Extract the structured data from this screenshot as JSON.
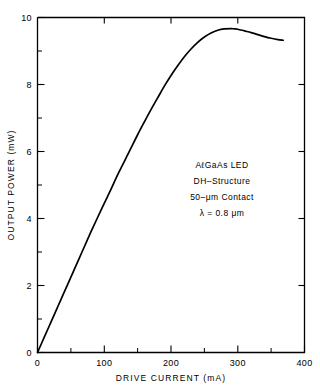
{
  "chart_data": {
    "type": "line",
    "title": "",
    "xlabel": "DRIVE CURRENT (mA)",
    "ylabel": "OUTPUT POWER (mW)",
    "xlim": [
      0,
      400
    ],
    "ylim": [
      0,
      10
    ],
    "grid": false,
    "legend": null,
    "x_ticks_major": [
      0,
      100,
      200,
      300,
      400
    ],
    "x_tick_labels": [
      "0",
      "100",
      "200",
      "300",
      "400"
    ],
    "x_ticks_minor": [
      50,
      150,
      250,
      350
    ],
    "y_ticks_major": [
      0,
      2,
      4,
      6,
      8,
      10
    ],
    "y_tick_labels": [
      "0",
      "2",
      "4",
      "6",
      "8",
      "10"
    ],
    "y_ticks_minor": [
      1,
      3,
      5,
      7,
      9
    ],
    "series": [
      {
        "name": "AlGaAs LED L-I characteristic",
        "x": [
          0,
          10,
          20,
          30,
          40,
          50,
          60,
          70,
          80,
          90,
          100,
          110,
          120,
          130,
          140,
          150,
          160,
          170,
          180,
          190,
          200,
          210,
          220,
          230,
          240,
          250,
          260,
          270,
          280,
          290,
          295,
          300,
          310,
          320,
          330,
          340,
          350,
          360,
          368
        ],
        "y": [
          0.0,
          0.45,
          0.9,
          1.35,
          1.8,
          2.25,
          2.7,
          3.15,
          3.6,
          4.03,
          4.45,
          4.87,
          5.3,
          5.7,
          6.1,
          6.5,
          6.88,
          7.25,
          7.6,
          7.95,
          8.27,
          8.56,
          8.83,
          9.06,
          9.26,
          9.42,
          9.54,
          9.62,
          9.66,
          9.67,
          9.66,
          9.65,
          9.6,
          9.55,
          9.49,
          9.43,
          9.38,
          9.34,
          9.32
        ]
      }
    ],
    "peak": {
      "x": 293,
      "y": 9.67
    },
    "annotations": [
      "AℓGaAs LED",
      "DH–Structure",
      "50–μm Contact",
      "λ = 0.8 μm"
    ]
  }
}
